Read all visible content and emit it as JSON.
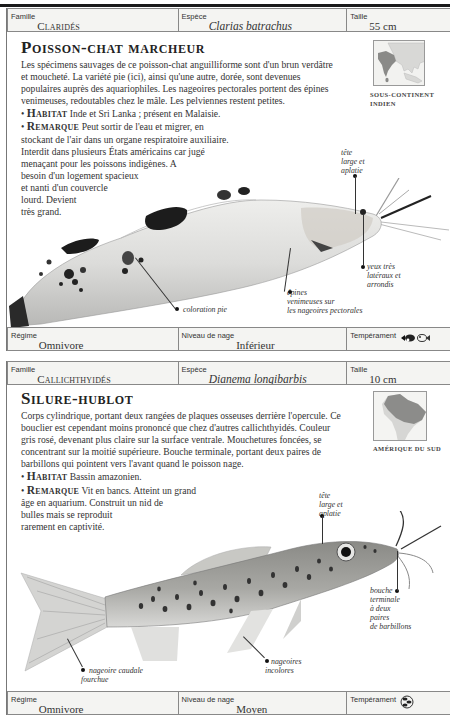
{
  "species": [
    {
      "header": {
        "family_label": "Famille",
        "family": "Claridés",
        "species_label": "Espèce",
        "species": "Clarias batrachus",
        "size_label": "Taille",
        "size": "55 cm"
      },
      "title": "Poisson-chat marcheur",
      "description": "Les spécimens sauvages de ce poisson-chat anguilliforme sont d'un brun verdâtre et moucheté. La variété pie (ici), ainsi qu'une autre, dorée, sont devenues populaires auprès des aquariophiles. Les nageoires pectorales portent des épines venimeuses, redoutables chez le mâle. Les pelviennes restent petites.",
      "habitat_label": "Habitat",
      "habitat": "Inde et Sri Lanka ; présent en Malaisie.",
      "remark_label": "Remarque",
      "remark_lines": [
        "Peut sortir de l'eau et migrer, en",
        "stockant de l'air dans un organe respiratoire auxiliaire.",
        "Interdit dans plusieurs États américains car jugé",
        "menaçant pour les poissons indigènes. A",
        "besoin d'un logement spacieux",
        "et nanti d'un couvercle",
        "lourd. Devient",
        "très grand."
      ],
      "map_caption_lines": [
        "Sous-continent",
        "indien"
      ],
      "annotations": {
        "head": [
          "tête",
          "large et",
          "aplatie"
        ],
        "eyes": [
          "yeux très",
          "latéraux et",
          "arrondis"
        ],
        "spines": [
          "épines",
          "venimeuses sur",
          "les nageoires pectorales"
        ],
        "pattern": [
          "coloration pie"
        ]
      },
      "footer": {
        "diet_label": "Régime",
        "diet": "Omnivore",
        "level_label": "Niveau de nage",
        "level": "Inférieur",
        "temperament_label": "Tempérament",
        "temperament_icon": "aggressive-fish-icon"
      }
    },
    {
      "header": {
        "family_label": "Famille",
        "family": "Callichthyidés",
        "species_label": "Espèce",
        "species": "Dianema longibarbis",
        "size_label": "Taille",
        "size": "10 cm"
      },
      "title": "Silure-hublot",
      "description": "Corps cylindrique, portant deux rangées de plaques osseuses derrière l'opercule. Ce bouclier est cependant moins prononcé que chez d'autres callichthyidés. Couleur gris rosé, devenant plus claire sur la surface ventrale. Mouchetures foncées, se concentrant sur la moitié supérieure. Bouche terminale, portant deux paires de barbillons qui pointent vers l'avant quand le poisson nage.",
      "habitat_label": "Habitat",
      "habitat": "Bassin amazonien.",
      "remark_label": "Remarque",
      "remark_lines": [
        "Vit en bancs. Atteint un grand",
        "âge en aquarium. Construit un nid de",
        "bulles mais se reproduit",
        "rarement en captivité."
      ],
      "map_caption_lines": [
        "Amérique du Sud"
      ],
      "annotations": {
        "head": [
          "tête",
          "large et",
          "aplatie"
        ],
        "mouth": [
          "bouche",
          "terminale",
          "à deux",
          "paires",
          "de barbillons"
        ],
        "tail": [
          "nageoire caudale",
          "fourchue"
        ],
        "fins": [
          "nageoires",
          "incolores"
        ]
      },
      "footer": {
        "diet_label": "Régime",
        "diet": "Omnivore",
        "level_label": "Niveau de nage",
        "level": "Moyen",
        "temperament_label": "Tempérament",
        "temperament_icon": "peaceful-community-icon"
      }
    }
  ]
}
